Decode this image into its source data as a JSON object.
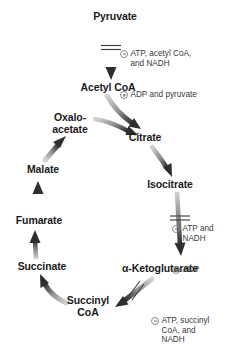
{
  "diagram": {
    "type": "metabolic-pathway-cycle",
    "background_color": "#ffffff",
    "text_color": "#1a1a1a",
    "annotation_color": "#3a3a3a",
    "arrow_color_dark": "#2e2e2e",
    "arrow_color_light": "#cfcfcf"
  },
  "nodes": [
    {
      "id": "pyruvate",
      "label": "Pyruvate",
      "x": 115,
      "y": 17
    },
    {
      "id": "acetyl-coa",
      "label": "Acetyl CoA",
      "x": 108,
      "y": 88
    },
    {
      "id": "oxaloacetate",
      "label": "Oxalo-\nacetate",
      "x": 70,
      "y": 123
    },
    {
      "id": "citrate",
      "label": "Citrate",
      "x": 145,
      "y": 138
    },
    {
      "id": "isocitrate",
      "label": "Isocitrate",
      "x": 170,
      "y": 185
    },
    {
      "id": "ketoglutarate",
      "label": "α-Ketoglutarate",
      "x": 160,
      "y": 269
    },
    {
      "id": "succinyl-coa",
      "label": "Succinyl\nCoA",
      "x": 88,
      "y": 306
    },
    {
      "id": "succinate",
      "label": "Succinate",
      "x": 42,
      "y": 267
    },
    {
      "id": "fumarate",
      "label": "Fumarate",
      "x": 39,
      "y": 221
    },
    {
      "id": "malate",
      "label": "Malate",
      "x": 43,
      "y": 170
    }
  ],
  "regulators": [
    {
      "id": "pdh-regulation",
      "reaction": "pyruvate-to-acetyl-coa",
      "x": 120,
      "y": 30,
      "lines": [
        {
          "sign": "minus",
          "text": "ATP, acetyl CoA,\nand NADH"
        },
        {
          "sign": "plus",
          "text": "ADP and pyruvate"
        }
      ]
    },
    {
      "id": "idh-regulation",
      "reaction": "isocitrate-to-alpha-ketoglutarate",
      "x": 172,
      "y": 205,
      "lines": [
        {
          "sign": "minus",
          "text": "ATP and\nNADH"
        },
        {
          "sign": "plus",
          "text": "ADP"
        }
      ]
    },
    {
      "id": "kgdh-regulation",
      "reaction": "alpha-ketoglutarate-to-succinyl-coa",
      "x": 151,
      "y": 297,
      "lines": [
        {
          "sign": "minus",
          "text": "ATP, succinyl\nCoA, and\nNADH"
        }
      ]
    }
  ],
  "arrows": [
    {
      "id": "pyruvate-to-acetyl-coa",
      "from": "pyruvate",
      "to": "acetyl-coa",
      "regulated": true
    },
    {
      "id": "acetyl-coa-to-citrate",
      "from": "acetyl-coa",
      "to": "citrate",
      "regulated": false
    },
    {
      "id": "oxaloacetate-to-citrate",
      "from": "oxaloacetate",
      "to": "citrate",
      "regulated": false
    },
    {
      "id": "citrate-to-isocitrate",
      "from": "citrate",
      "to": "isocitrate",
      "regulated": false
    },
    {
      "id": "isocitrate-to-ketoglutarate",
      "from": "isocitrate",
      "to": "ketoglutarate",
      "regulated": true
    },
    {
      "id": "ketoglutarate-to-succinyl",
      "from": "ketoglutarate",
      "to": "succinyl-coa",
      "regulated": true
    },
    {
      "id": "succinyl-to-succinate",
      "from": "succinyl-coa",
      "to": "succinate",
      "regulated": false
    },
    {
      "id": "succinate-to-fumarate",
      "from": "succinate",
      "to": "fumarate",
      "regulated": false
    },
    {
      "id": "fumarate-to-malate",
      "from": "fumarate",
      "to": "malate",
      "regulated": false
    },
    {
      "id": "malate-to-oxaloacetate",
      "from": "malate",
      "to": "oxaloacetate",
      "regulated": false
    }
  ]
}
